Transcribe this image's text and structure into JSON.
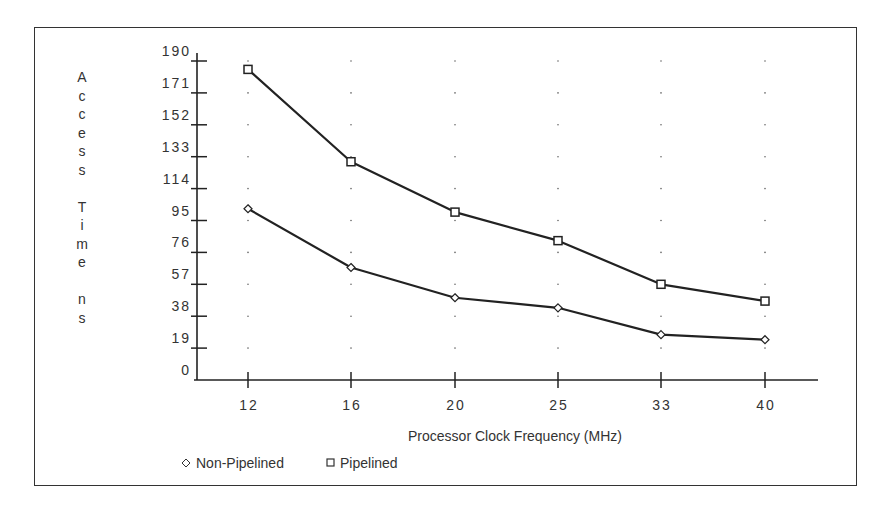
{
  "chart_data": {
    "type": "line",
    "title": "",
    "xlabel": "Processor Clock Frequency (MHz)",
    "ylabel": "Access Time ns",
    "x": [
      "12",
      "16",
      "20",
      "25",
      "33",
      "40"
    ],
    "categories": [
      "12",
      "16",
      "20",
      "25",
      "33",
      "40"
    ],
    "yticks": [
      0,
      19,
      38,
      57,
      76,
      95,
      114,
      133,
      152,
      171,
      190
    ],
    "ylim": [
      0,
      190
    ],
    "grid": "dotted",
    "legend_position": "bottom-left",
    "series": [
      {
        "name": "Non-Pipelined",
        "marker": "diamond",
        "values": [
          102,
          67,
          49,
          43,
          27,
          24
        ]
      },
      {
        "name": "Pipelined",
        "marker": "square",
        "values": [
          185,
          130,
          100,
          83,
          57,
          47
        ]
      }
    ]
  },
  "labels": {
    "ylabel_lines": [
      "A",
      "c",
      "c",
      "e",
      "s",
      "s",
      "",
      "T",
      "i",
      "m",
      "e",
      "",
      "n",
      "s"
    ],
    "xlabel": "Processor Clock Frequency (MHz)",
    "legend": [
      {
        "symbol": "◇",
        "label": "Non-Pipelined"
      },
      {
        "symbol": "□",
        "label": "Pipelined"
      }
    ]
  }
}
